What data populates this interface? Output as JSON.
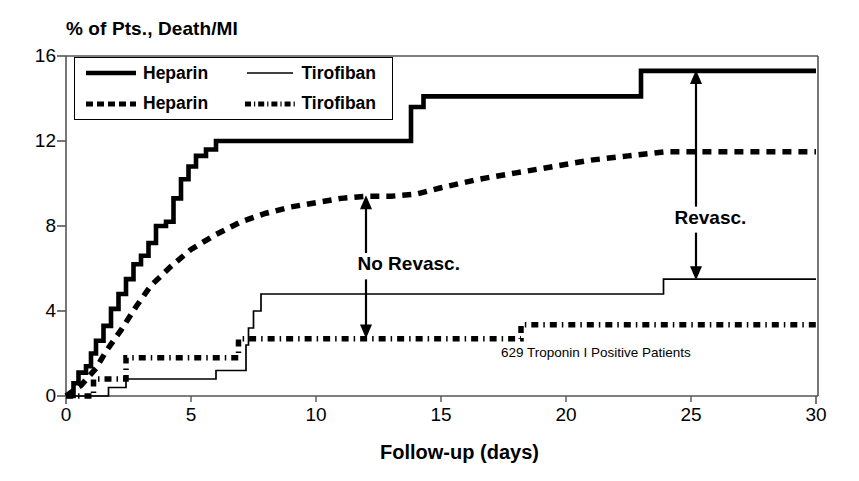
{
  "chart_data": {
    "type": "line",
    "title": "% of Pts., Death/MI",
    "xlabel": "Follow-up (days)",
    "ylabel": "% of Pts., Death/MI",
    "xlim": [
      0,
      30
    ],
    "ylim": [
      0,
      16
    ],
    "xticks": [
      "0",
      "5",
      "10",
      "15",
      "20",
      "25",
      "30"
    ],
    "yticks": [
      "0",
      "4",
      "8",
      "12",
      "16"
    ],
    "grid": false,
    "legend_position": "top-left-inside",
    "legend": [
      {
        "label": "Heparin",
        "style": "thick-solid"
      },
      {
        "label": "Tirofiban",
        "style": "thin-solid"
      },
      {
        "label": "Heparin",
        "style": "thick-dashed"
      },
      {
        "label": "Tirofiban",
        "style": "thick-dashdot"
      }
    ],
    "series": [
      {
        "name": "Heparin",
        "group": "Revasc.",
        "style": "thick-solid",
        "points": [
          [
            0,
            0
          ],
          [
            0.3,
            0.6
          ],
          [
            0.5,
            1.1
          ],
          [
            0.8,
            1.4
          ],
          [
            1.0,
            2.0
          ],
          [
            1.2,
            2.6
          ],
          [
            1.5,
            3.3
          ],
          [
            1.8,
            4.1
          ],
          [
            2.1,
            4.8
          ],
          [
            2.4,
            5.5
          ],
          [
            2.7,
            6.2
          ],
          [
            3.0,
            6.6
          ],
          [
            3.3,
            7.2
          ],
          [
            3.6,
            8.0
          ],
          [
            4.0,
            8.2
          ],
          [
            4.3,
            9.3
          ],
          [
            4.6,
            10.2
          ],
          [
            4.9,
            10.8
          ],
          [
            5.2,
            11.3
          ],
          [
            5.6,
            11.6
          ],
          [
            6.0,
            12.0
          ],
          [
            13.5,
            12.0
          ],
          [
            13.8,
            13.6
          ],
          [
            14.3,
            14.1
          ],
          [
            22.6,
            14.1
          ],
          [
            23.0,
            15.3
          ],
          [
            30,
            15.3
          ]
        ]
      },
      {
        "name": "Heparin",
        "group": "No Revasc.",
        "style": "thick-dashed",
        "points": [
          [
            0,
            0
          ],
          [
            0.6,
            0.5
          ],
          [
            1.2,
            1.3
          ],
          [
            1.6,
            2.1
          ],
          [
            2.2,
            3.1
          ],
          [
            2.8,
            4.2
          ],
          [
            3.4,
            5.2
          ],
          [
            4.2,
            6.1
          ],
          [
            5.0,
            6.9
          ],
          [
            6.0,
            7.6
          ],
          [
            7.0,
            8.2
          ],
          [
            8.0,
            8.6
          ],
          [
            9.0,
            8.9
          ],
          [
            10.0,
            9.1
          ],
          [
            11.0,
            9.3
          ],
          [
            12.0,
            9.4
          ],
          [
            13.0,
            9.4
          ],
          [
            14.0,
            9.5
          ],
          [
            15.0,
            9.8
          ],
          [
            16.5,
            10.2
          ],
          [
            18.0,
            10.5
          ],
          [
            19.5,
            10.8
          ],
          [
            21.0,
            11.1
          ],
          [
            22.5,
            11.3
          ],
          [
            24.0,
            11.5
          ],
          [
            26.0,
            11.5
          ],
          [
            30,
            11.5
          ]
        ]
      },
      {
        "name": "Tirofiban",
        "group": "Revasc.",
        "style": "thin-solid",
        "points": [
          [
            0,
            0
          ],
          [
            1.6,
            0
          ],
          [
            1.7,
            0.4
          ],
          [
            2.3,
            0.4
          ],
          [
            2.4,
            0.8
          ],
          [
            5.9,
            0.8
          ],
          [
            6.0,
            1.2
          ],
          [
            7.1,
            1.2
          ],
          [
            7.2,
            2.4
          ],
          [
            7.3,
            3.2
          ],
          [
            7.5,
            4.0
          ],
          [
            7.8,
            4.8
          ],
          [
            23.7,
            4.8
          ],
          [
            23.9,
            5.5
          ],
          [
            30,
            5.5
          ]
        ]
      },
      {
        "name": "Tirofiban",
        "group": "No Revasc.",
        "style": "thick-dashdot",
        "points": [
          [
            0,
            0
          ],
          [
            1.0,
            0
          ],
          [
            1.1,
            0.8
          ],
          [
            2.3,
            0.8
          ],
          [
            2.4,
            1.8
          ],
          [
            6.7,
            1.8
          ],
          [
            6.9,
            2.7
          ],
          [
            18.0,
            2.7
          ],
          [
            18.2,
            3.35
          ],
          [
            30,
            3.35
          ]
        ]
      }
    ],
    "annotations": [
      {
        "text": "No Revasc.",
        "x": 14.1,
        "y": 6.1,
        "arrow_from_y": 9.4,
        "arrow_to_y": 2.75,
        "arrow_x": 12.0
      },
      {
        "text": "Revasc.",
        "x": 25.9,
        "y": 8.3,
        "arrow_from_y": 15.3,
        "arrow_to_y": 5.5,
        "arrow_x": 25.2
      },
      {
        "text": "629 Troponin I Positive Patients",
        "x": 22.0,
        "y": 2.0
      }
    ]
  }
}
